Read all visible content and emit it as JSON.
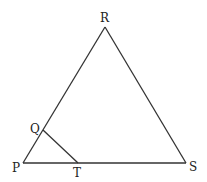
{
  "diagram": {
    "type": "geometry-triangle",
    "stroke_color": "#333333",
    "points": {
      "P": {
        "label": "P",
        "x": 23,
        "y": 163,
        "lx": 12,
        "ly": 172
      },
      "Q": {
        "label": "Q",
        "x": 43,
        "y": 130,
        "lx": 30,
        "ly": 131
      },
      "R": {
        "label": "R",
        "x": 105,
        "y": 27,
        "lx": 100,
        "ly": 22
      },
      "S": {
        "label": "S",
        "x": 186,
        "y": 163,
        "lx": 189,
        "ly": 171
      },
      "T": {
        "label": "T",
        "x": 78,
        "y": 163,
        "lx": 74,
        "ly": 175
      }
    },
    "segments": [
      [
        "P",
        "R"
      ],
      [
        "R",
        "S"
      ],
      [
        "P",
        "S"
      ],
      [
        "Q",
        "T"
      ]
    ]
  }
}
